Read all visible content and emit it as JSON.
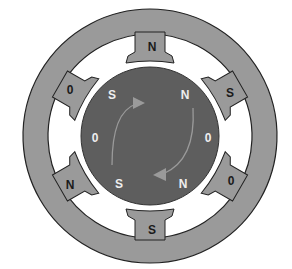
{
  "diagram": {
    "type": "stepper-motor-cross-section",
    "colors": {
      "stator": "#9a9a9a",
      "stator_outline": "#222222",
      "rotor": "#5e5e5e",
      "rotor_gap": "#ffffff",
      "background": "#ffffff",
      "arrow": "#8c8c8c",
      "stator_text": "#1a1a1a",
      "rotor_text": "#eeeeee"
    },
    "stator_poles": [
      {
        "position": "top",
        "label": "N"
      },
      {
        "position": "upper-right",
        "label": "S"
      },
      {
        "position": "lower-right",
        "label": "0"
      },
      {
        "position": "bottom",
        "label": "S"
      },
      {
        "position": "lower-left",
        "label": "N"
      },
      {
        "position": "upper-left",
        "label": "0"
      }
    ],
    "rotor_labels": [
      {
        "position": "upper-left",
        "label": "S"
      },
      {
        "position": "upper-right",
        "label": "N"
      },
      {
        "position": "right",
        "label": "0"
      },
      {
        "position": "lower-right",
        "label": "N"
      },
      {
        "position": "lower-left",
        "label": "S"
      },
      {
        "position": "left",
        "label": "0"
      }
    ],
    "arrows": [
      {
        "name": "upper-arc-arrow",
        "direction": "clockwise"
      },
      {
        "name": "lower-arc-arrow",
        "direction": "clockwise"
      }
    ]
  }
}
